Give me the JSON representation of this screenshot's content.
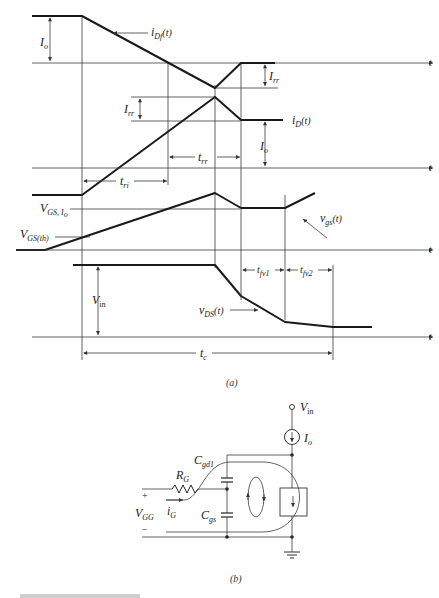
{
  "figure": {
    "part_a": {
      "caption": "(a)",
      "axis_label": "t",
      "waveforms": {
        "idf": {
          "label_main": "i",
          "label_sub": "Df",
          "label_suffix": "(t)"
        },
        "id": {
          "label_main": "i",
          "label_sub": "D",
          "label_suffix": "(t)"
        },
        "vgs": {
          "label_main": "v",
          "label_sub": "gs",
          "label_suffix": "(t)"
        },
        "vds": {
          "label_main": "v",
          "label_sub": "DS",
          "label_suffix": "(t)"
        }
      },
      "levels": {
        "io_top": {
          "main": "I",
          "sub": "o"
        },
        "irr_top": {
          "main": "I",
          "sub": "rr"
        },
        "irr_mid": {
          "main": "I",
          "sub": "rr"
        },
        "io_mid": {
          "main": "I",
          "sub": "o"
        },
        "vgs_io": {
          "main": "V",
          "sub": "GS, I",
          "sub2": "o"
        },
        "vgs_th": {
          "main": "V",
          "sub": "GS(th)"
        },
        "vin": {
          "main": "V",
          "sub": "in"
        }
      },
      "intervals": {
        "tri": {
          "main": "t",
          "sub": "ri"
        },
        "trr": {
          "main": "t",
          "sub": "rr"
        },
        "tfv1": {
          "main": "t",
          "sub": "fv1"
        },
        "tfv2": {
          "main": "t",
          "sub": "fv2"
        },
        "tc": {
          "main": "t",
          "sub": "c"
        }
      }
    },
    "part_b": {
      "caption": "(b)",
      "vin": {
        "main": "V",
        "sub": "in"
      },
      "io": {
        "main": "I",
        "sub": "o"
      },
      "rg": {
        "main": "R",
        "sub": "G"
      },
      "ig": {
        "main": "i",
        "sub": "G"
      },
      "cgd": {
        "main": "C",
        "sub": "gd1"
      },
      "cgs": {
        "main": "C",
        "sub": "gs"
      },
      "vgg": {
        "main": "V",
        "sub": "GG"
      },
      "plus": "+",
      "minus": "−"
    },
    "footer_partial": "...(truncated caption text)"
  }
}
